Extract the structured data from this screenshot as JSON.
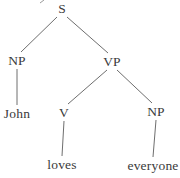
{
  "tree": {
    "nodes": [
      {
        "id": "S",
        "label": "S",
        "x": 62,
        "y": 9
      },
      {
        "id": "NP1",
        "label": "NP",
        "x": 17,
        "y": 61
      },
      {
        "id": "VP",
        "label": "VP",
        "x": 112,
        "y": 62
      },
      {
        "id": "John",
        "label": "John",
        "x": 17,
        "y": 114
      },
      {
        "id": "V",
        "label": "V",
        "x": 64,
        "y": 113
      },
      {
        "id": "NP2",
        "label": "NP",
        "x": 156,
        "y": 112
      },
      {
        "id": "loves",
        "label": "loves",
        "x": 62,
        "y": 165
      },
      {
        "id": "everyone",
        "label": "everyone",
        "x": 153,
        "y": 166
      }
    ],
    "edges": [
      {
        "from": "S",
        "to": "NP1"
      },
      {
        "from": "S",
        "to": "VP"
      },
      {
        "from": "NP1",
        "to": "John"
      },
      {
        "from": "VP",
        "to": "V"
      },
      {
        "from": "VP",
        "to": "NP2"
      },
      {
        "from": "V",
        "to": "loves"
      },
      {
        "from": "NP2",
        "to": "everyone"
      }
    ]
  },
  "artifact_mark": {
    "x1": 40,
    "y1": 3,
    "x2": 44,
    "y2": 0
  },
  "colors": {
    "background": "#ffffff",
    "text": "#3a3a3a",
    "line": "#6e6e6e",
    "artifact": "#9a9a9a"
  }
}
